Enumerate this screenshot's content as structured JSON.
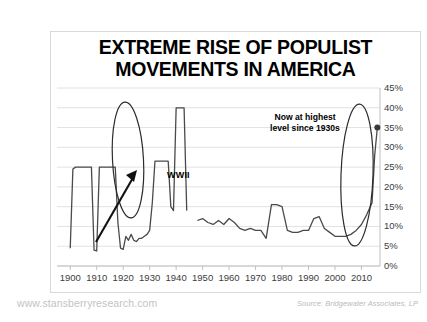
{
  "title_line1": "EXTREME RISE OF POPULIST",
  "title_line2": "MOVEMENTS IN AMERICA",
  "footer": {
    "website": "www.stansberryresearch.com",
    "source": "Source: Bridgewater Associates, LP"
  },
  "annotations": {
    "wwii": "WWII",
    "highest_line1": "Now at highest",
    "highest_line2": "level since 1930s"
  },
  "colors": {
    "line": "#4a4a4a",
    "gridline": "#e2e2e2",
    "axis": "#bfbfbf",
    "text": "#3c3c3c",
    "title": "#000000",
    "annotation": "#000000",
    "footer_website": "#c3c3c3",
    "footer_source": "#b9b9b9",
    "frame": "#d9d9d9",
    "marker": "#3a3a3a"
  },
  "chart_data": {
    "type": "line",
    "title": "EXTREME RISE OF POPULIST MOVEMENTS IN AMERICA",
    "xlabel": "",
    "ylabel": "",
    "xlim": [
      1895,
      2017
    ],
    "ylim": [
      0,
      45
    ],
    "ytick_values": [
      0,
      5,
      10,
      15,
      20,
      25,
      30,
      35,
      40,
      45
    ],
    "ytick_labels": [
      "0%",
      "5%",
      "10%",
      "15%",
      "20%",
      "25%",
      "30%",
      "35%",
      "40%",
      "45%"
    ],
    "xtick_values": [
      1900,
      1910,
      1920,
      1930,
      1940,
      1950,
      1960,
      1970,
      1980,
      1990,
      2000,
      2010
    ],
    "xtick_labels": [
      "1900",
      "1910",
      "1920",
      "1930",
      "1940",
      "1950",
      "1960",
      "1970",
      "1980",
      "1990",
      "2000",
      "2010"
    ],
    "grid": true,
    "legend": "none",
    "series": [
      {
        "name": "Populist vote share (early period)",
        "x": [
          1900,
          1901,
          1902,
          1903,
          1904,
          1905,
          1906,
          1907,
          1908,
          1909,
          1910,
          1911,
          1912,
          1913,
          1914,
          1915,
          1916,
          1917,
          1918,
          1919,
          1920,
          1921,
          1922,
          1923,
          1924,
          1925,
          1926,
          1927,
          1928,
          1929,
          1930,
          1931,
          1932,
          1933,
          1934,
          1935,
          1936,
          1937,
          1938,
          1939,
          1940,
          1941,
          1942,
          1943,
          1944
        ],
        "y": [
          4.5,
          24.5,
          25.0,
          25.0,
          25.0,
          25.0,
          25.0,
          25.0,
          25.0,
          4.0,
          3.8,
          25.0,
          25.0,
          25.0,
          25.0,
          25.0,
          25.0,
          25.0,
          11.0,
          4.5,
          4.2,
          7.5,
          6.5,
          8.0,
          6.5,
          6.2,
          7.0,
          7.0,
          7.5,
          8.0,
          9.0,
          16.0,
          26.5,
          26.5,
          26.5,
          26.5,
          26.5,
          26.5,
          15.0,
          14.0,
          40.0,
          40.0,
          40.0,
          40.0,
          14.0
        ]
      },
      {
        "name": "Populist vote share (modern period)",
        "x": [
          1948,
          1950,
          1952,
          1954,
          1956,
          1958,
          1960,
          1962,
          1964,
          1966,
          1968,
          1970,
          1972,
          1974,
          1976,
          1978,
          1980,
          1982,
          1984,
          1986,
          1988,
          1990,
          1992,
          1994,
          1996,
          1998,
          2000,
          2002,
          2004,
          2006,
          2008,
          2010,
          2012,
          2014,
          2015,
          2016
        ],
        "y": [
          11.5,
          12.0,
          11.0,
          10.5,
          11.5,
          10.5,
          12.0,
          11.0,
          9.5,
          9.0,
          9.5,
          9.0,
          9.0,
          7.0,
          15.5,
          15.5,
          15.0,
          9.0,
          8.5,
          8.5,
          9.0,
          9.0,
          12.0,
          12.5,
          9.5,
          8.5,
          7.5,
          7.5,
          7.5,
          8.0,
          9.0,
          10.5,
          13.0,
          16.0,
          28.0,
          35.0
        ]
      }
    ],
    "callouts": [
      {
        "label": "WWII",
        "x": 1935,
        "y": 26.5
      },
      {
        "label": "Now at highest level since 1930s",
        "x": 2016,
        "y": 35.0
      }
    ],
    "highlight_ellipses": [
      {
        "center_x": 1936,
        "center_y": 26.0,
        "note": "WWII-era spike"
      },
      {
        "center_x": 2014,
        "center_y": 20.0,
        "note": "present-day spike"
      }
    ],
    "markers": [
      {
        "x": 2016,
        "y": 35.0
      }
    ]
  }
}
